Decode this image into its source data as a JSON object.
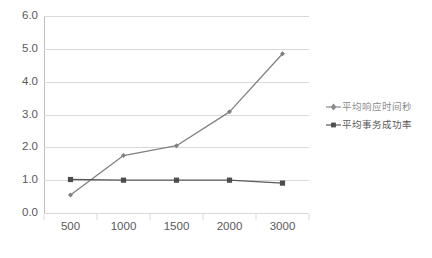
{
  "chart_data": {
    "type": "line",
    "title": "",
    "subtitle": "",
    "xlabel": "",
    "ylabel": "",
    "categories": [
      "500",
      "1000",
      "1500",
      "2000",
      "3000"
    ],
    "series": [
      {
        "name": "平均响应时间秒",
        "values": [
          0.55,
          1.75,
          2.05,
          3.08,
          4.85
        ],
        "color": "#808080",
        "marker": "diamond"
      },
      {
        "name": "平均事务成功率",
        "values": [
          1.02,
          1.0,
          1.0,
          1.0,
          0.91
        ],
        "color": "#5a5a5a",
        "marker": "square"
      }
    ],
    "ylim": [
      0.0,
      6.0
    ],
    "y_ticks": [
      "0.0",
      "1.0",
      "2.0",
      "3.0",
      "4.0",
      "5.0",
      "6.0"
    ],
    "y_tick_values": [
      0.0,
      1.0,
      2.0,
      3.0,
      4.0,
      5.0,
      6.0
    ],
    "grid": true,
    "grid_axis": "y",
    "grid_color": "#d9d9d9",
    "legend_position": "right",
    "background_color": "#ffffff",
    "axis_label_color": "#595959"
  },
  "legend": {
    "items": [
      {
        "label": "平均响应时间秒",
        "marker": "diamond-line-marker",
        "color": "#8c8c8c"
      },
      {
        "label": "平均事务成功率",
        "marker": "square-line-marker",
        "color": "#595959"
      }
    ]
  },
  "caption": {
    "text": ""
  }
}
